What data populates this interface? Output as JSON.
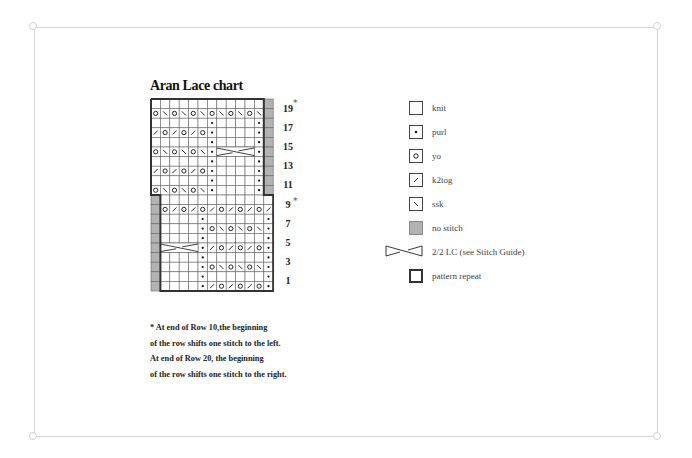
{
  "title": "Aran Lace chart",
  "chart": {
    "columns": 13,
    "rows_top_to_bottom": [
      {
        "row": 20,
        "cells": [
          "k",
          "k",
          "k",
          "k",
          "k",
          "k",
          "k",
          "k",
          "k",
          "k",
          "k",
          "k",
          "ns"
        ]
      },
      {
        "row": 19,
        "cells": [
          "yo",
          "ssk",
          "yo",
          "ssk",
          "yo",
          "ssk",
          "yo",
          "ssk",
          "yo",
          "ssk",
          "yo",
          "ssk",
          "ns"
        ]
      },
      {
        "row": 18,
        "cells": [
          "k",
          "k",
          "k",
          "k",
          "k",
          "k",
          "p",
          "k",
          "k",
          "k",
          "k",
          "p",
          "ns"
        ]
      },
      {
        "row": 17,
        "cells": [
          "k2tog",
          "yo",
          "k2tog",
          "yo",
          "k2tog",
          "yo",
          "p",
          "k",
          "k",
          "k",
          "k",
          "p",
          "ns"
        ]
      },
      {
        "row": 16,
        "cells": [
          "k",
          "k",
          "k",
          "k",
          "k",
          "k",
          "p",
          "k",
          "k",
          "k",
          "k",
          "p",
          "ns"
        ]
      },
      {
        "row": 15,
        "cells": [
          "yo",
          "ssk",
          "yo",
          "ssk",
          "yo",
          "ssk",
          "p",
          "c1",
          "c2",
          "c3",
          "c4",
          "p",
          "ns"
        ]
      },
      {
        "row": 14,
        "cells": [
          "k",
          "k",
          "k",
          "k",
          "k",
          "k",
          "p",
          "k",
          "k",
          "k",
          "k",
          "p",
          "ns"
        ]
      },
      {
        "row": 13,
        "cells": [
          "k2tog",
          "yo",
          "k2tog",
          "yo",
          "k2tog",
          "yo",
          "p",
          "k",
          "k",
          "k",
          "k",
          "p",
          "ns"
        ]
      },
      {
        "row": 12,
        "cells": [
          "k",
          "k",
          "k",
          "k",
          "k",
          "k",
          "p",
          "k",
          "k",
          "k",
          "k",
          "p",
          "ns"
        ]
      },
      {
        "row": 11,
        "cells": [
          "yo",
          "ssk",
          "yo",
          "ssk",
          "yo",
          "ssk",
          "p",
          "k",
          "k",
          "k",
          "k",
          "p",
          "ns"
        ]
      },
      {
        "row": 10,
        "cells": [
          "ns",
          "k",
          "k",
          "k",
          "k",
          "k",
          "k",
          "k",
          "k",
          "k",
          "k",
          "k",
          "k"
        ]
      },
      {
        "row": 9,
        "cells": [
          "ns",
          "yo",
          "k2tog",
          "yo",
          "k2tog",
          "yo",
          "k2tog",
          "yo",
          "k2tog",
          "yo",
          "k2tog",
          "yo",
          "k2tog"
        ]
      },
      {
        "row": 8,
        "cells": [
          "ns",
          "k",
          "k",
          "k",
          "k",
          "p",
          "k",
          "k",
          "k",
          "k",
          "k",
          "k",
          "p"
        ]
      },
      {
        "row": 7,
        "cells": [
          "ns",
          "k",
          "k",
          "k",
          "k",
          "p",
          "yo",
          "ssk",
          "yo",
          "ssk",
          "yo",
          "ssk",
          "p"
        ]
      },
      {
        "row": 6,
        "cells": [
          "ns",
          "k",
          "k",
          "k",
          "k",
          "p",
          "k",
          "k",
          "k",
          "k",
          "k",
          "k",
          "p"
        ]
      },
      {
        "row": 5,
        "cells": [
          "ns",
          "c1",
          "c2",
          "c3",
          "c4",
          "p",
          "k2tog",
          "yo",
          "k2tog",
          "yo",
          "k2tog",
          "yo",
          "p"
        ]
      },
      {
        "row": 4,
        "cells": [
          "ns",
          "k",
          "k",
          "k",
          "k",
          "p",
          "k",
          "k",
          "k",
          "k",
          "k",
          "k",
          "p"
        ]
      },
      {
        "row": 3,
        "cells": [
          "ns",
          "k",
          "k",
          "k",
          "k",
          "p",
          "yo",
          "ssk",
          "yo",
          "ssk",
          "yo",
          "ssk",
          "p"
        ]
      },
      {
        "row": 2,
        "cells": [
          "ns",
          "k",
          "k",
          "k",
          "k",
          "p",
          "k",
          "k",
          "k",
          "k",
          "k",
          "k",
          "p"
        ]
      },
      {
        "row": 1,
        "cells": [
          "ns",
          "k",
          "k",
          "k",
          "k",
          "p",
          "k2tog",
          "yo",
          "k2tog",
          "yo",
          "k2tog",
          "yo",
          "p"
        ]
      }
    ],
    "row_labels": [
      "19",
      "17",
      "15",
      "13",
      "11",
      "9",
      "7",
      "5",
      "3",
      "1"
    ],
    "star_marks": [
      "*",
      "*"
    ]
  },
  "legend": [
    {
      "symbol": "knit-box",
      "label": "knit"
    },
    {
      "symbol": "purl-dot",
      "label": "purl"
    },
    {
      "symbol": "yo-circle",
      "label": "yo"
    },
    {
      "symbol": "k2tog-slash",
      "label": "k2tog"
    },
    {
      "symbol": "ssk-backslash",
      "label": "ssk"
    },
    {
      "symbol": "no-stitch-gray",
      "label": "no stitch"
    },
    {
      "symbol": "cable-cross",
      "label": "2/2 LC (see Stitch Guide)"
    },
    {
      "symbol": "repeat-box",
      "label": "pattern repeat"
    }
  ],
  "notes": [
    "* At end of Row 10,the beginning",
    "of the row shifts one stitch to the left.",
    "At end of Row 20, the beginning",
    "of the row shifts one stitch to the right."
  ],
  "colors": {
    "frame": "#d6d6d6",
    "no_stitch": "#b3b3b3",
    "grid": "#555555",
    "repeat_border": "#333333"
  }
}
